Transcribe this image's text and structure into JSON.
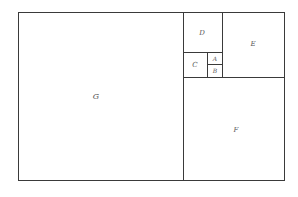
{
  "diagram": {
    "title": "",
    "stroke_color": "#3a3a3a",
    "label_color": "#555555",
    "regions": {
      "G": {
        "label": "G"
      },
      "D": {
        "label": "D"
      },
      "E": {
        "label": "E"
      },
      "C": {
        "label": "C"
      },
      "A": {
        "label": "A"
      },
      "B": {
        "label": "B"
      },
      "F": {
        "label": "F"
      }
    }
  }
}
